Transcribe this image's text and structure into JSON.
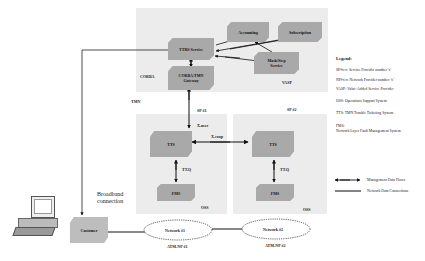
{
  "regions": {
    "tmn": "TMN",
    "corba": "CORBA",
    "vasp": "VASP",
    "sp1": "SP #1",
    "sp2": "SP #2",
    "oss1": "OSS",
    "oss2": "OSS"
  },
  "nodes": {
    "ttrs_service": "TTRS Service",
    "corba_tmn_gateway_line1": "CORBA/TMN",
    "corba_tmn_gateway_line2": "Gateway",
    "accounting": "Accounting",
    "subscription": "Subscription",
    "mask_step_line1": "Mask/Step",
    "mask_step_line2": "Service",
    "tts1": "TTS",
    "fms1": "FMS",
    "tts2": "TTS",
    "fms2": "FMS",
    "customer": "Customer",
    "network1": "Network #1",
    "network2": "Network #2"
  },
  "edge_labels": {
    "x_user": "X.user",
    "x_coop": "X.coop",
    "ttq1": "TT.Q",
    "ttq2": "TT.Q",
    "atm_np1": "ATM-NP #1",
    "atm_np2": "ATM-NP #2",
    "broadband_line1": "Broadband",
    "broadband_line2": "connection"
  },
  "legend": {
    "title": "Legend:",
    "items": [
      "SP#x:x: Service Provider number 'x'",
      "NP#x:x: Network Provider number 'x'",
      "VASP: Value-Added Service Provider",
      "OSS: Operations Support System",
      "TTS: TMN Trouble Ticketing System",
      "FMS:",
      "Network Layer Fault Management System"
    ],
    "management_flows": "Management Data Flows",
    "network_connections": "Network Data Connections"
  },
  "colors": {
    "region_bg": "#ececec",
    "box_fill": "#a9a9a9",
    "line": "#111111"
  }
}
